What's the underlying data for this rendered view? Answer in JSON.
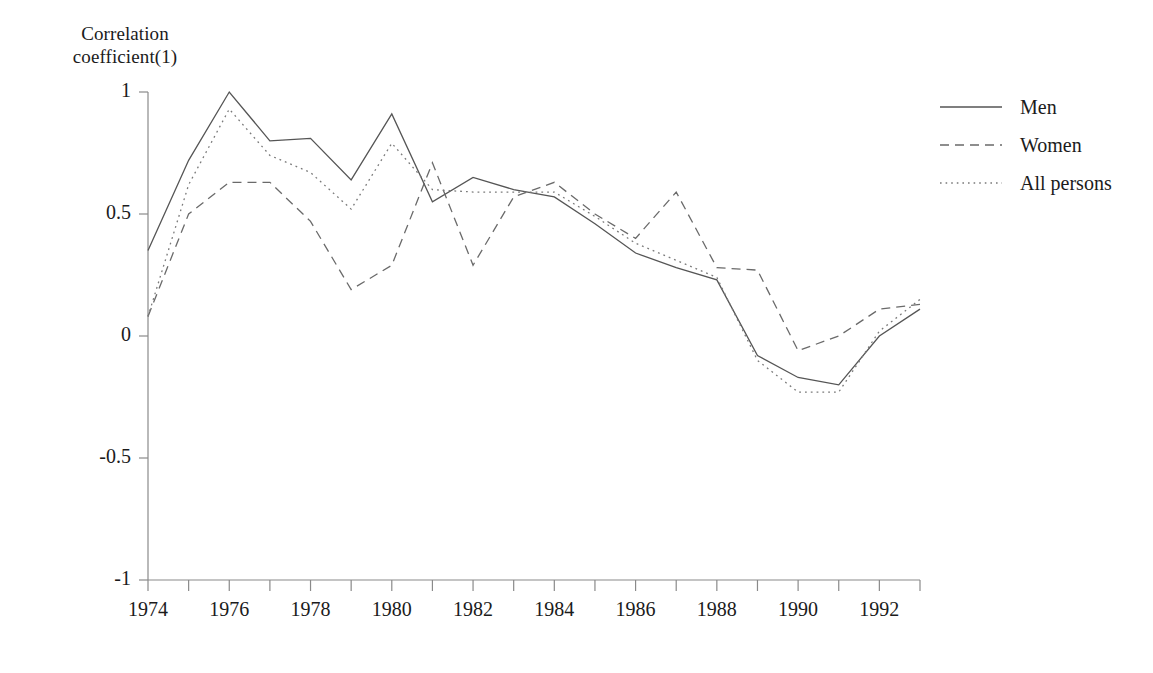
{
  "chart_data": {
    "type": "line",
    "title": "",
    "ylabel_line1": "Correlation",
    "ylabel_line2": "coefficient(1)",
    "xlabel": "",
    "x": [
      1974,
      1975,
      1976,
      1977,
      1978,
      1979,
      1980,
      1981,
      1982,
      1983,
      1984,
      1985,
      1986,
      1987,
      1988,
      1989,
      1990,
      1991,
      1992,
      1993
    ],
    "xtick_labels": [
      "1974",
      "1976",
      "1978",
      "1980",
      "1982",
      "1984",
      "1986",
      "1988",
      "1990",
      "1992"
    ],
    "xtick_values": [
      1974,
      1976,
      1978,
      1980,
      1982,
      1984,
      1986,
      1988,
      1990,
      1992
    ],
    "ytick_labels": [
      "1",
      "0.5",
      "0",
      "-0.5",
      "-1"
    ],
    "ytick_values": [
      1,
      0.5,
      0,
      -0.5,
      -1
    ],
    "xlim": [
      1974,
      1993
    ],
    "ylim": [
      -1,
      1
    ],
    "grid": false,
    "legend_position": "right",
    "series": [
      {
        "name": "Men",
        "style": "solid",
        "color": "#555555",
        "values": [
          0.35,
          0.72,
          1.0,
          0.8,
          0.81,
          0.64,
          0.91,
          0.55,
          0.65,
          0.6,
          0.57,
          0.46,
          0.34,
          0.28,
          0.23,
          -0.08,
          -0.17,
          -0.2,
          0.0,
          0.11
        ]
      },
      {
        "name": "Women",
        "style": "dashed",
        "color": "#6a6a6a",
        "values": [
          0.08,
          0.5,
          0.63,
          0.63,
          0.47,
          0.19,
          0.29,
          0.71,
          0.29,
          0.57,
          0.63,
          0.5,
          0.4,
          0.59,
          0.28,
          0.27,
          -0.06,
          0.0,
          0.11,
          0.13
        ]
      },
      {
        "name": "All persons",
        "style": "dotted",
        "color": "#7a7a7a",
        "values": [
          0.08,
          0.62,
          0.93,
          0.74,
          0.67,
          0.52,
          0.79,
          0.6,
          0.59,
          0.59,
          0.59,
          0.49,
          0.38,
          0.31,
          0.24,
          -0.1,
          -0.23,
          -0.23,
          0.02,
          0.15
        ]
      }
    ]
  },
  "legend": {
    "items": [
      {
        "label": "Men",
        "style": "solid"
      },
      {
        "label": "Women",
        "style": "dashed"
      },
      {
        "label": "All persons",
        "style": "dotted"
      }
    ]
  },
  "axis": {
    "line_color": "#8a8a8a"
  }
}
